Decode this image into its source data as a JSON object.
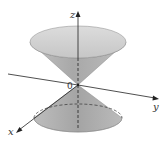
{
  "diagram": {
    "labels": {
      "z_axis": "z",
      "y_axis": "y",
      "x_axis": "x",
      "origin": "0"
    },
    "colors": {
      "cone_fill_light": "#d4d4d4",
      "cone_fill_dark": "#9e9e9e",
      "axis": "#222222",
      "background": "#ffffff"
    }
  }
}
